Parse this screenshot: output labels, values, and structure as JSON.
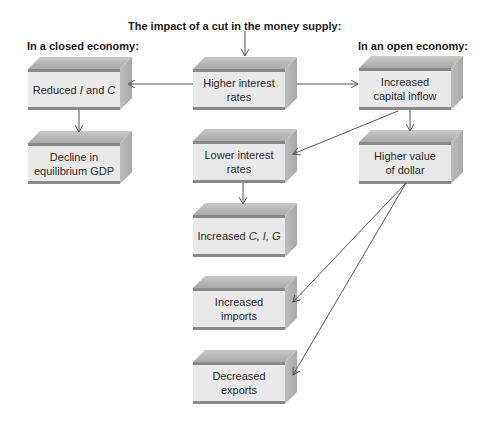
{
  "title": "The impact of a cut in the money supply:",
  "headings": {
    "closed": "In a closed economy:",
    "open": "In an open economy:"
  },
  "boxes": {
    "higher_interest": {
      "line1": "Higher interest",
      "line2": "rates"
    },
    "reduced_ic": {
      "pre": "Reduced ",
      "i": "I",
      "mid": " and ",
      "c": "C"
    },
    "decline_gdp": {
      "line1": "Decline in",
      "line2": "equilibrium GDP"
    },
    "capital_inflow": {
      "line1": "Increased",
      "line2": "capital inflow"
    },
    "value_dollar": {
      "line1": "Higher value",
      "line2": "of dollar"
    },
    "lower_interest": {
      "line1": "Lower interest",
      "line2": "rates"
    },
    "increased_cig": {
      "pre": "Increased ",
      "vars": "C, I, G"
    },
    "increased_imports": {
      "line1": "Increased",
      "line2": "imports"
    },
    "decreased_exports": {
      "line1": "Decreased",
      "line2": "exports"
    }
  },
  "colors": {
    "arrow": "#555555",
    "box_front": "#e9e9e9",
    "box_top": "#b8b8b8",
    "box_stripe": "#8a8a8a"
  }
}
